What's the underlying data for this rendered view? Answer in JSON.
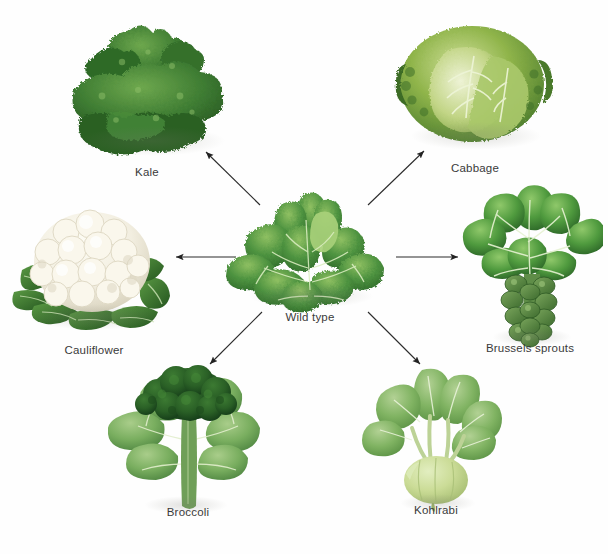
{
  "figure": {
    "center": {
      "label": "Wild type",
      "plant": "wild-mustard-rosette",
      "colors": {
        "leaf_dark": "#2f6b2a",
        "leaf_mid": "#4e9340",
        "leaf_light": "#8fc062",
        "vein": "#d9e9c0"
      }
    },
    "varieties": [
      {
        "id": "kale",
        "label": "Kale",
        "plant": "kale-curly-leaves",
        "position": "top-left",
        "colors": {
          "leaf_dark": "#23521f",
          "leaf_mid": "#3f7d33",
          "leaf_light": "#6ea84e",
          "vein": "#cfe3b1"
        }
      },
      {
        "id": "cabbage",
        "label": "Cabbage",
        "plant": "cabbage-head",
        "position": "top-right",
        "colors": {
          "leaf_dark": "#4a7b2c",
          "leaf_mid": "#7fa83f",
          "leaf_light": "#c3d58a",
          "vein": "#eaf0cf"
        }
      },
      {
        "id": "cauliflower",
        "label": "Cauliflower",
        "plant": "cauliflower-curd",
        "position": "left",
        "colors": {
          "curd": "#f6f3e6",
          "curd_shade": "#ded9c6",
          "leaf_dark": "#2c5d26",
          "leaf_mid": "#4b8a3a",
          "vein": "#d6e8bd"
        }
      },
      {
        "id": "brussels-sprouts",
        "label": "Brussels sprouts",
        "plant": "brussels-sprout-stalk",
        "position": "right",
        "colors": {
          "leaf_dark": "#2e6b2a",
          "leaf_mid": "#58a043",
          "leaf_light": "#86bf63",
          "vein": "#e3efcd",
          "sprout": "#4e7f3a"
        }
      },
      {
        "id": "broccoli",
        "label": "Broccoli",
        "plant": "broccoli-head",
        "position": "bottom-left",
        "colors": {
          "head_dark": "#1f4a1d",
          "head_mid": "#2d6327",
          "leaf_mid": "#6fa659",
          "leaf_light": "#9cc47f",
          "vein": "#e2eecd"
        }
      },
      {
        "id": "kohlrabi",
        "label": "Kohlrabi",
        "plant": "kohlrabi-bulb",
        "position": "bottom-right",
        "colors": {
          "bulb": "#cddc9a",
          "bulb_shade": "#aec279",
          "leaf_mid": "#79ac5b",
          "leaf_light": "#a6c988",
          "vein": "#e6f1d5",
          "stem": "#bcd296"
        }
      }
    ],
    "arrows": [
      {
        "id": "arrow-to-kale",
        "from": "wild-type",
        "to": "kale",
        "direction": "up-left"
      },
      {
        "id": "arrow-to-cabbage",
        "from": "wild-type",
        "to": "cabbage",
        "direction": "up-right"
      },
      {
        "id": "arrow-to-cauliflower",
        "from": "wild-type",
        "to": "cauliflower",
        "direction": "left"
      },
      {
        "id": "arrow-to-brussels-sprouts",
        "from": "wild-type",
        "to": "brussels-sprouts",
        "direction": "right"
      },
      {
        "id": "arrow-to-broccoli",
        "from": "wild-type",
        "to": "broccoli",
        "direction": "down-left"
      },
      {
        "id": "arrow-to-kohlrabi",
        "from": "wild-type",
        "to": "kohlrabi",
        "direction": "down-right"
      }
    ],
    "bottom_caption": {
      "fignum": "",
      "text": ""
    }
  }
}
